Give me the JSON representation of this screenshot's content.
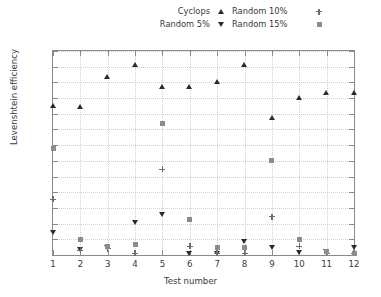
{
  "chart_data": {
    "type": "scatter",
    "title": "",
    "xlabel": "Test number",
    "ylabel": "Levenshtein efficiency",
    "xlim": [
      1,
      12
    ],
    "ylim": [
      0,
      1.3
    ],
    "xticks": [
      "1",
      "2",
      "3",
      "4",
      "5",
      "6",
      "7",
      "8",
      "9",
      "10",
      "11",
      "12"
    ],
    "yticks": [
      "0",
      "0.1",
      "0.2",
      "0.3",
      "0.4",
      "0.5",
      "0.6",
      "0.7",
      "0.8",
      "0.9",
      "1",
      "1.1",
      "1.2",
      "1.3"
    ],
    "grid": true,
    "legend_position": "top",
    "x": [
      1,
      2,
      3,
      4,
      5,
      6,
      7,
      8,
      9,
      10,
      11,
      12
    ],
    "series": [
      {
        "name": "Cyclops",
        "marker": "triangle-up",
        "color": "#2b2b2b",
        "values": [
          0.95,
          0.94,
          1.135,
          1.21,
          1.07,
          1.07,
          1.1,
          1.21,
          0.87,
          1.0,
          1.03,
          1.03
        ]
      },
      {
        "name": "Random 5%",
        "marker": "triangle-down",
        "color": "#2b2b2b",
        "values": [
          0.14,
          0.035,
          0.045,
          0.205,
          0.255,
          0.01,
          0.01,
          0.085,
          0.045,
          0.015,
          0.02,
          0.045
        ]
      },
      {
        "name": "Random 10%",
        "marker": "plus",
        "color": "#6e6e6e",
        "values": [
          0.355,
          0.03,
          0.04,
          0.01,
          0.545,
          0.055,
          0.01,
          0.01,
          0.245,
          0.055,
          0.01,
          0.01
        ]
      },
      {
        "name": "Random 15%",
        "marker": "square",
        "color": "#8c8c8c",
        "values": [
          0.68,
          0.1,
          0.055,
          0.065,
          0.84,
          0.225,
          0.045,
          0.05,
          0.605,
          0.1,
          0.02,
          0.01
        ]
      }
    ]
  },
  "legend": {
    "entries": [
      {
        "label": "Cyclops",
        "marker": "triangle-up"
      },
      {
        "label": "Random 10%",
        "marker": "plus"
      },
      {
        "label": "Random 5%",
        "marker": "triangle-down"
      },
      {
        "label": "Random 15%",
        "marker": "square"
      }
    ]
  }
}
